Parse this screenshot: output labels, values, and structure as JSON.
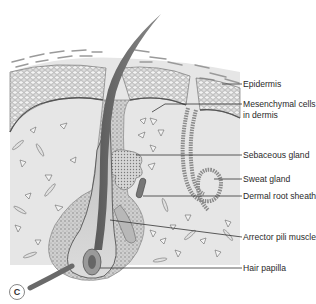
{
  "figure": {
    "panel_label": "C",
    "labels": [
      {
        "id": "epidermis",
        "text": "Epidermis"
      },
      {
        "id": "mesenchymal",
        "text": "Mesenchymal cells"
      },
      {
        "id": "mesenchymal2",
        "text": "in dermis"
      },
      {
        "id": "sebaceous",
        "text": "Sebaceous gland"
      },
      {
        "id": "sweat",
        "text": "Sweat gland"
      },
      {
        "id": "dermal_root_sheath",
        "text": "Dermal root sheath"
      },
      {
        "id": "arrector",
        "text": "Arrector pili muscle"
      },
      {
        "id": "papilla",
        "text": "Hair papilla"
      }
    ],
    "colors": {
      "dermis": "#e4e4e4",
      "epidermis_cells": "#cfcfcf",
      "hair_shaft": "#6f6f6f",
      "follicle_bulb": "#c9c9c9",
      "outline": "#555555",
      "leader_line": "#333333"
    }
  }
}
